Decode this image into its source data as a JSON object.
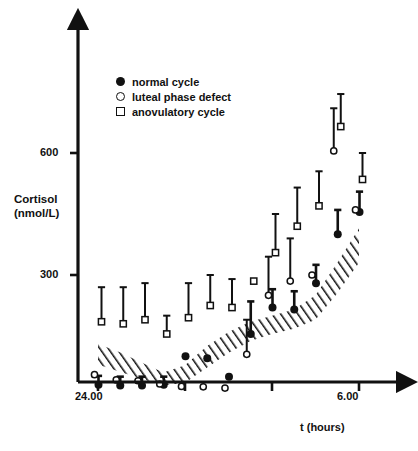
{
  "figure": {
    "axis_color": "#111111",
    "background": "#ffffff"
  },
  "axes": {
    "ylabel_line1": "Cortisol",
    "ylabel_line2": "(nmol/L)",
    "xlabel": "t (hours)",
    "ytick_600": "600",
    "ytick_300": "300",
    "xtick_left": "24.00",
    "xtick_right": "6.00"
  },
  "legend": {
    "items": [
      {
        "marker": "filled-circle-icon",
        "label": "normal cycle"
      },
      {
        "marker": "open-circle-icon",
        "label": "luteal phase defect"
      },
      {
        "marker": "open-square-icon",
        "label": "anovulatory cycle"
      }
    ]
  },
  "chart_data": {
    "type": "scatter",
    "title": "",
    "subtitle": "",
    "xlabel": "t (hours)",
    "ylabel": "Cortisol (nmol/L)",
    "xlim": [
      24.0,
      6.5
    ],
    "ylim": [
      0,
      760
    ],
    "yticks": [
      300,
      600
    ],
    "xticks": [
      {
        "x": 24.0,
        "label": "24.00"
      },
      {
        "x": 2.0,
        "label": ""
      },
      {
        "x": 4.0,
        "label": ""
      },
      {
        "x": 6.0,
        "label": "6.00"
      }
    ],
    "grid": false,
    "legend_position": "upper-left-inside",
    "errorbar_style": "upper-only-with-cap",
    "x_values_hours": [
      24.0,
      24.5,
      25.0,
      25.5,
      26.0,
      26.5,
      27.0,
      27.5,
      28.0,
      28.5,
      29.0,
      29.5
    ],
    "series": [
      {
        "name": "normal cycle",
        "marker": "filled-circle",
        "values": [
          30,
          28,
          28,
          30,
          100,
          95,
          50,
          155,
          220,
          215,
          280,
          400,
          455
        ],
        "errors_upper": [
          22,
          22,
          22,
          20,
          0,
          0,
          0,
          80,
          45,
          45,
          45,
          60,
          50
        ],
        "x": [
          24.0,
          24.5,
          25.0,
          25.5,
          26.0,
          26.5,
          27.0,
          27.5,
          28.0,
          28.5,
          29.0,
          29.5,
          30.0
        ]
      },
      {
        "name": "luteal phase defect",
        "marker": "open-circle",
        "values": [
          55,
          42,
          40,
          32,
          26,
          25,
          22,
          105,
          250,
          285,
          300,
          605,
          460
        ],
        "errors_upper": [
          0,
          0,
          0,
          0,
          0,
          0,
          0,
          85,
          95,
          105,
          0,
          105,
          0
        ],
        "x": [
          24.0,
          24.5,
          25.0,
          25.5,
          26.0,
          26.5,
          27.0,
          27.5,
          28.0,
          28.5,
          29.0,
          29.5,
          30.0
        ]
      },
      {
        "name": "anovulatory cycle",
        "marker": "open-square",
        "values": [
          185,
          180,
          190,
          155,
          195,
          225,
          220,
          285,
          355,
          420,
          470,
          665,
          535
        ],
        "errors_upper": [
          85,
          90,
          90,
          45,
          85,
          75,
          70,
          0,
          95,
          95,
          85,
          80,
          65
        ],
        "x": [
          24.0,
          24.5,
          25.0,
          25.5,
          26.0,
          26.5,
          27.0,
          27.5,
          28.0,
          28.5,
          29.0,
          29.5,
          30.0
        ]
      }
    ],
    "reference_band": {
      "name": "hatched reference range",
      "style": "diagonal-hatch",
      "x": [
        24.0,
        24.5,
        25.0,
        25.5,
        26.0,
        26.5,
        27.0,
        27.5,
        28.0,
        28.5,
        29.0,
        29.5,
        30.0
      ],
      "upper": [
        130,
        110,
        85,
        60,
        78,
        125,
        160,
        185,
        200,
        215,
        250,
        330,
        415
      ],
      "lower": [
        80,
        62,
        45,
        28,
        35,
        72,
        108,
        138,
        155,
        168,
        190,
        255,
        330
      ]
    },
    "annotations": []
  }
}
